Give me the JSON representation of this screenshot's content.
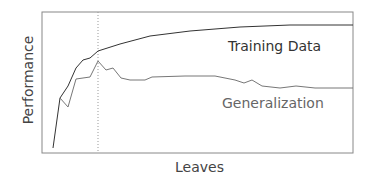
{
  "chart_data": {
    "type": "line",
    "title": "",
    "xlabel": "Leaves",
    "ylabel": "Performance",
    "grid": false,
    "legend_position": "inline labels",
    "annotations": [
      "vertical dotted line marking optimal tree size"
    ],
    "series": [
      {
        "name": "Training Data",
        "color": "#333333",
        "points": [
          [
            53,
            148
          ],
          [
            60,
            98
          ],
          [
            68,
            86
          ],
          [
            76,
            68
          ],
          [
            83,
            60
          ],
          [
            90,
            58
          ],
          [
            98,
            51
          ],
          [
            120,
            44
          ],
          [
            150,
            36
          ],
          [
            190,
            31
          ],
          [
            240,
            27
          ],
          [
            290,
            25
          ],
          [
            353,
            25
          ]
        ]
      },
      {
        "name": "Generalization",
        "color": "#777777",
        "points": [
          [
            60,
            98
          ],
          [
            68,
            107
          ],
          [
            76,
            79
          ],
          [
            90,
            77
          ],
          [
            98,
            61
          ],
          [
            106,
            70
          ],
          [
            113,
            68
          ],
          [
            121,
            78
          ],
          [
            130,
            80
          ],
          [
            145,
            80
          ],
          [
            152,
            77
          ],
          [
            185,
            76
          ],
          [
            215,
            76
          ],
          [
            235,
            80
          ],
          [
            244,
            83
          ],
          [
            252,
            80
          ],
          [
            262,
            86
          ],
          [
            280,
            88
          ],
          [
            296,
            86
          ],
          [
            315,
            88
          ],
          [
            353,
            88
          ]
        ]
      }
    ],
    "marker_x": 98
  },
  "labels": {
    "ylabel": "Performance",
    "xlabel": "Leaves",
    "training": "Training Data",
    "generalization": "Generalization"
  }
}
